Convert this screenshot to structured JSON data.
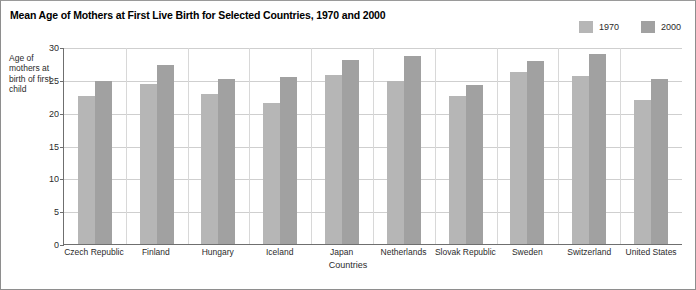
{
  "title": "Mean Age of Mothers at First Live Birth for Selected Countries, 1970 and 2000",
  "legend": {
    "items": [
      {
        "label": "1970",
        "color": "#b6b6b6"
      },
      {
        "label": "2000",
        "color": "#a1a1a1"
      }
    ]
  },
  "axes": {
    "y_title": "Age of mothers at birth of first child",
    "x_title": "Countries",
    "y_ticks": [
      "30",
      "25",
      "20",
      "15",
      "10",
      "5",
      "0"
    ]
  },
  "chart_data": {
    "type": "bar",
    "title": "Mean Age of Mothers at First Live Birth for Selected Countries, 1970 and 2000",
    "xlabel": "Countries",
    "ylabel": "Age of mothers at birth of first child",
    "ylim": [
      0,
      30
    ],
    "ytick_step": 5,
    "grid": true,
    "legend_position": "top-right",
    "categories": [
      "Czech Republic",
      "Finland",
      "Hungary",
      "Iceland",
      "Japan",
      "Netherlands",
      "Slovak Republic",
      "Sweden",
      "Switzerland",
      "United States"
    ],
    "series": [
      {
        "name": "1970",
        "color": "#b6b6b6",
        "values": [
          22.5,
          24.4,
          22.9,
          21.5,
          25.7,
          24.9,
          22.6,
          26.2,
          25.6,
          21.9
        ]
      },
      {
        "name": "2000",
        "color": "#a1a1a1",
        "values": [
          24.9,
          27.2,
          25.1,
          25.5,
          28.0,
          28.6,
          24.2,
          27.9,
          28.9,
          25.1
        ]
      }
    ]
  }
}
